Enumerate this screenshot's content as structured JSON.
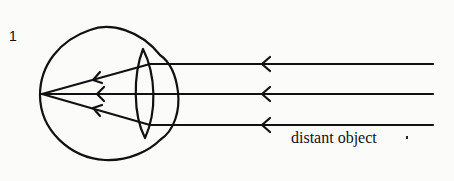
{
  "figure": {
    "number_label": "1",
    "caption": "distant object",
    "colors": {
      "stroke": "#111111",
      "background": "#fbfbfa"
    },
    "rays": [
      {
        "y": 64,
        "arrow_x": 263
      },
      {
        "y": 94,
        "arrow_x": 263
      },
      {
        "y": 125,
        "arrow_x": 263
      }
    ],
    "focal_point": {
      "x": 42,
      "y": 94
    }
  }
}
